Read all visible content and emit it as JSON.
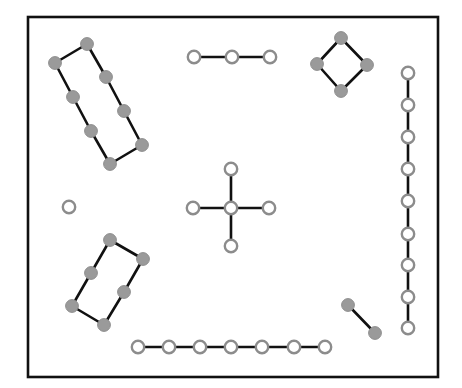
{
  "diagram": {
    "title": "",
    "frame": {
      "x": 28,
      "y": 17,
      "width": 410,
      "height": 360
    },
    "colors": {
      "edge": "#111111",
      "filled_node": "#9a9a9a",
      "ring_node_stroke": "#8c8c8c",
      "ring_node_fill": "#ffffff",
      "frame": "#111111"
    },
    "components": [
      {
        "name": "top-left-rectangle",
        "node_style": "filled",
        "nodes": [
          [
            87,
            44
          ],
          [
            106,
            77
          ],
          [
            124,
            111
          ],
          [
            142,
            145
          ],
          [
            110,
            164
          ],
          [
            91,
            131
          ],
          [
            73,
            97
          ],
          [
            55,
            63
          ]
        ],
        "closed": true
      },
      {
        "name": "top-chain",
        "node_style": "ring",
        "nodes": [
          [
            194,
            57
          ],
          [
            232,
            57
          ],
          [
            270,
            57
          ]
        ],
        "closed": false
      },
      {
        "name": "diamond",
        "node_style": "filled",
        "nodes": [
          [
            341,
            38
          ],
          [
            367,
            65
          ],
          [
            341,
            91
          ],
          [
            317,
            64
          ]
        ],
        "closed": true
      },
      {
        "name": "right-vertical-chain",
        "node_style": "ring",
        "nodes": [
          [
            408,
            73
          ],
          [
            408,
            105
          ],
          [
            408,
            137
          ],
          [
            408,
            169
          ],
          [
            408,
            201
          ],
          [
            408,
            234
          ],
          [
            408,
            265
          ],
          [
            408,
            297
          ],
          [
            408,
            328
          ]
        ],
        "closed": false
      },
      {
        "name": "center-cross",
        "node_style": "ring",
        "center": [
          231,
          208
        ],
        "arms": [
          [
            231,
            169
          ],
          [
            231,
            246
          ],
          [
            193,
            208
          ],
          [
            269,
            208
          ]
        ]
      },
      {
        "name": "isolated-node",
        "node_style": "ring",
        "nodes": [
          [
            69,
            207
          ]
        ],
        "closed": false
      },
      {
        "name": "bottom-left-parallelogram",
        "node_style": "filled",
        "nodes": [
          [
            110,
            240
          ],
          [
            143,
            259
          ],
          [
            124,
            292
          ],
          [
            104,
            325
          ],
          [
            72,
            306
          ],
          [
            91,
            273
          ]
        ],
        "closed": true
      },
      {
        "name": "bottom-chain",
        "node_style": "ring",
        "nodes": [
          [
            138,
            347
          ],
          [
            169,
            347
          ],
          [
            200,
            347
          ],
          [
            231,
            347
          ],
          [
            262,
            347
          ],
          [
            294,
            347
          ],
          [
            325,
            347
          ]
        ],
        "closed": false
      },
      {
        "name": "diagonal-pair",
        "node_style": "filled",
        "nodes": [
          [
            348,
            305
          ],
          [
            375,
            333
          ]
        ],
        "closed": false
      }
    ]
  }
}
